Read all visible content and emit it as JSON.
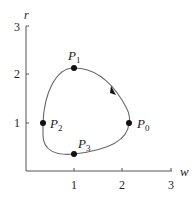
{
  "diagram": {
    "axes": {
      "x_label": "w",
      "y_label": "r",
      "x_ticks": [
        "1",
        "2",
        "3"
      ],
      "y_ticks": [
        "1",
        "2",
        "3"
      ]
    },
    "points": [
      {
        "name": "P",
        "sub": "0",
        "w": 2.15,
        "r": 1.0
      },
      {
        "name": "P",
        "sub": "1",
        "w": 1.0,
        "r": 2.15
      },
      {
        "name": "P",
        "sub": "2",
        "w": 0.35,
        "r": 1.0
      },
      {
        "name": "P",
        "sub": "3",
        "w": 1.0,
        "r": 0.35
      }
    ],
    "curve": "closed orbit through P0, P1, P2, P3",
    "direction": "counterclockwise",
    "colors": {
      "axis": "#555555",
      "curve": "#666666",
      "point": "#111111"
    }
  }
}
